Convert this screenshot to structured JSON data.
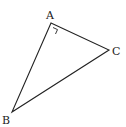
{
  "diagram": {
    "type": "right-triangle",
    "stroke_color": "#222222",
    "vertices": {
      "A": {
        "label": "A",
        "x": 51,
        "y": 23
      },
      "B": {
        "label": "B",
        "x": 12,
        "y": 112
      },
      "C": {
        "label": "C",
        "x": 109,
        "y": 50
      }
    },
    "right_angle_at": "A"
  }
}
